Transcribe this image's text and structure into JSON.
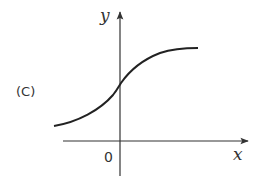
{
  "figure": {
    "option_label": "(C)",
    "x_axis_label": "x",
    "y_axis_label": "y",
    "origin_label": "0",
    "curve_description": "Increasing S-shaped curve, defined for all x, positive y-intercept, approaching horizontal asymptote as x increases and approaching x-axis from above as x decreases",
    "colors": {
      "axes": "#333333",
      "curve": "#222222",
      "background": "#ffffff"
    }
  }
}
